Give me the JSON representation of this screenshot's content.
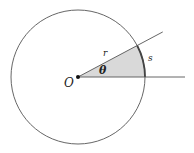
{
  "diagram": {
    "labels": {
      "center": "O",
      "radius": "r",
      "angle": "θ",
      "arc": "s"
    },
    "angle_degrees": 28,
    "colors": {
      "stroke": "#555555",
      "sector_fill": "#d9d9d9",
      "arc_stroke": "#444444",
      "center_dot": "#111111"
    }
  }
}
